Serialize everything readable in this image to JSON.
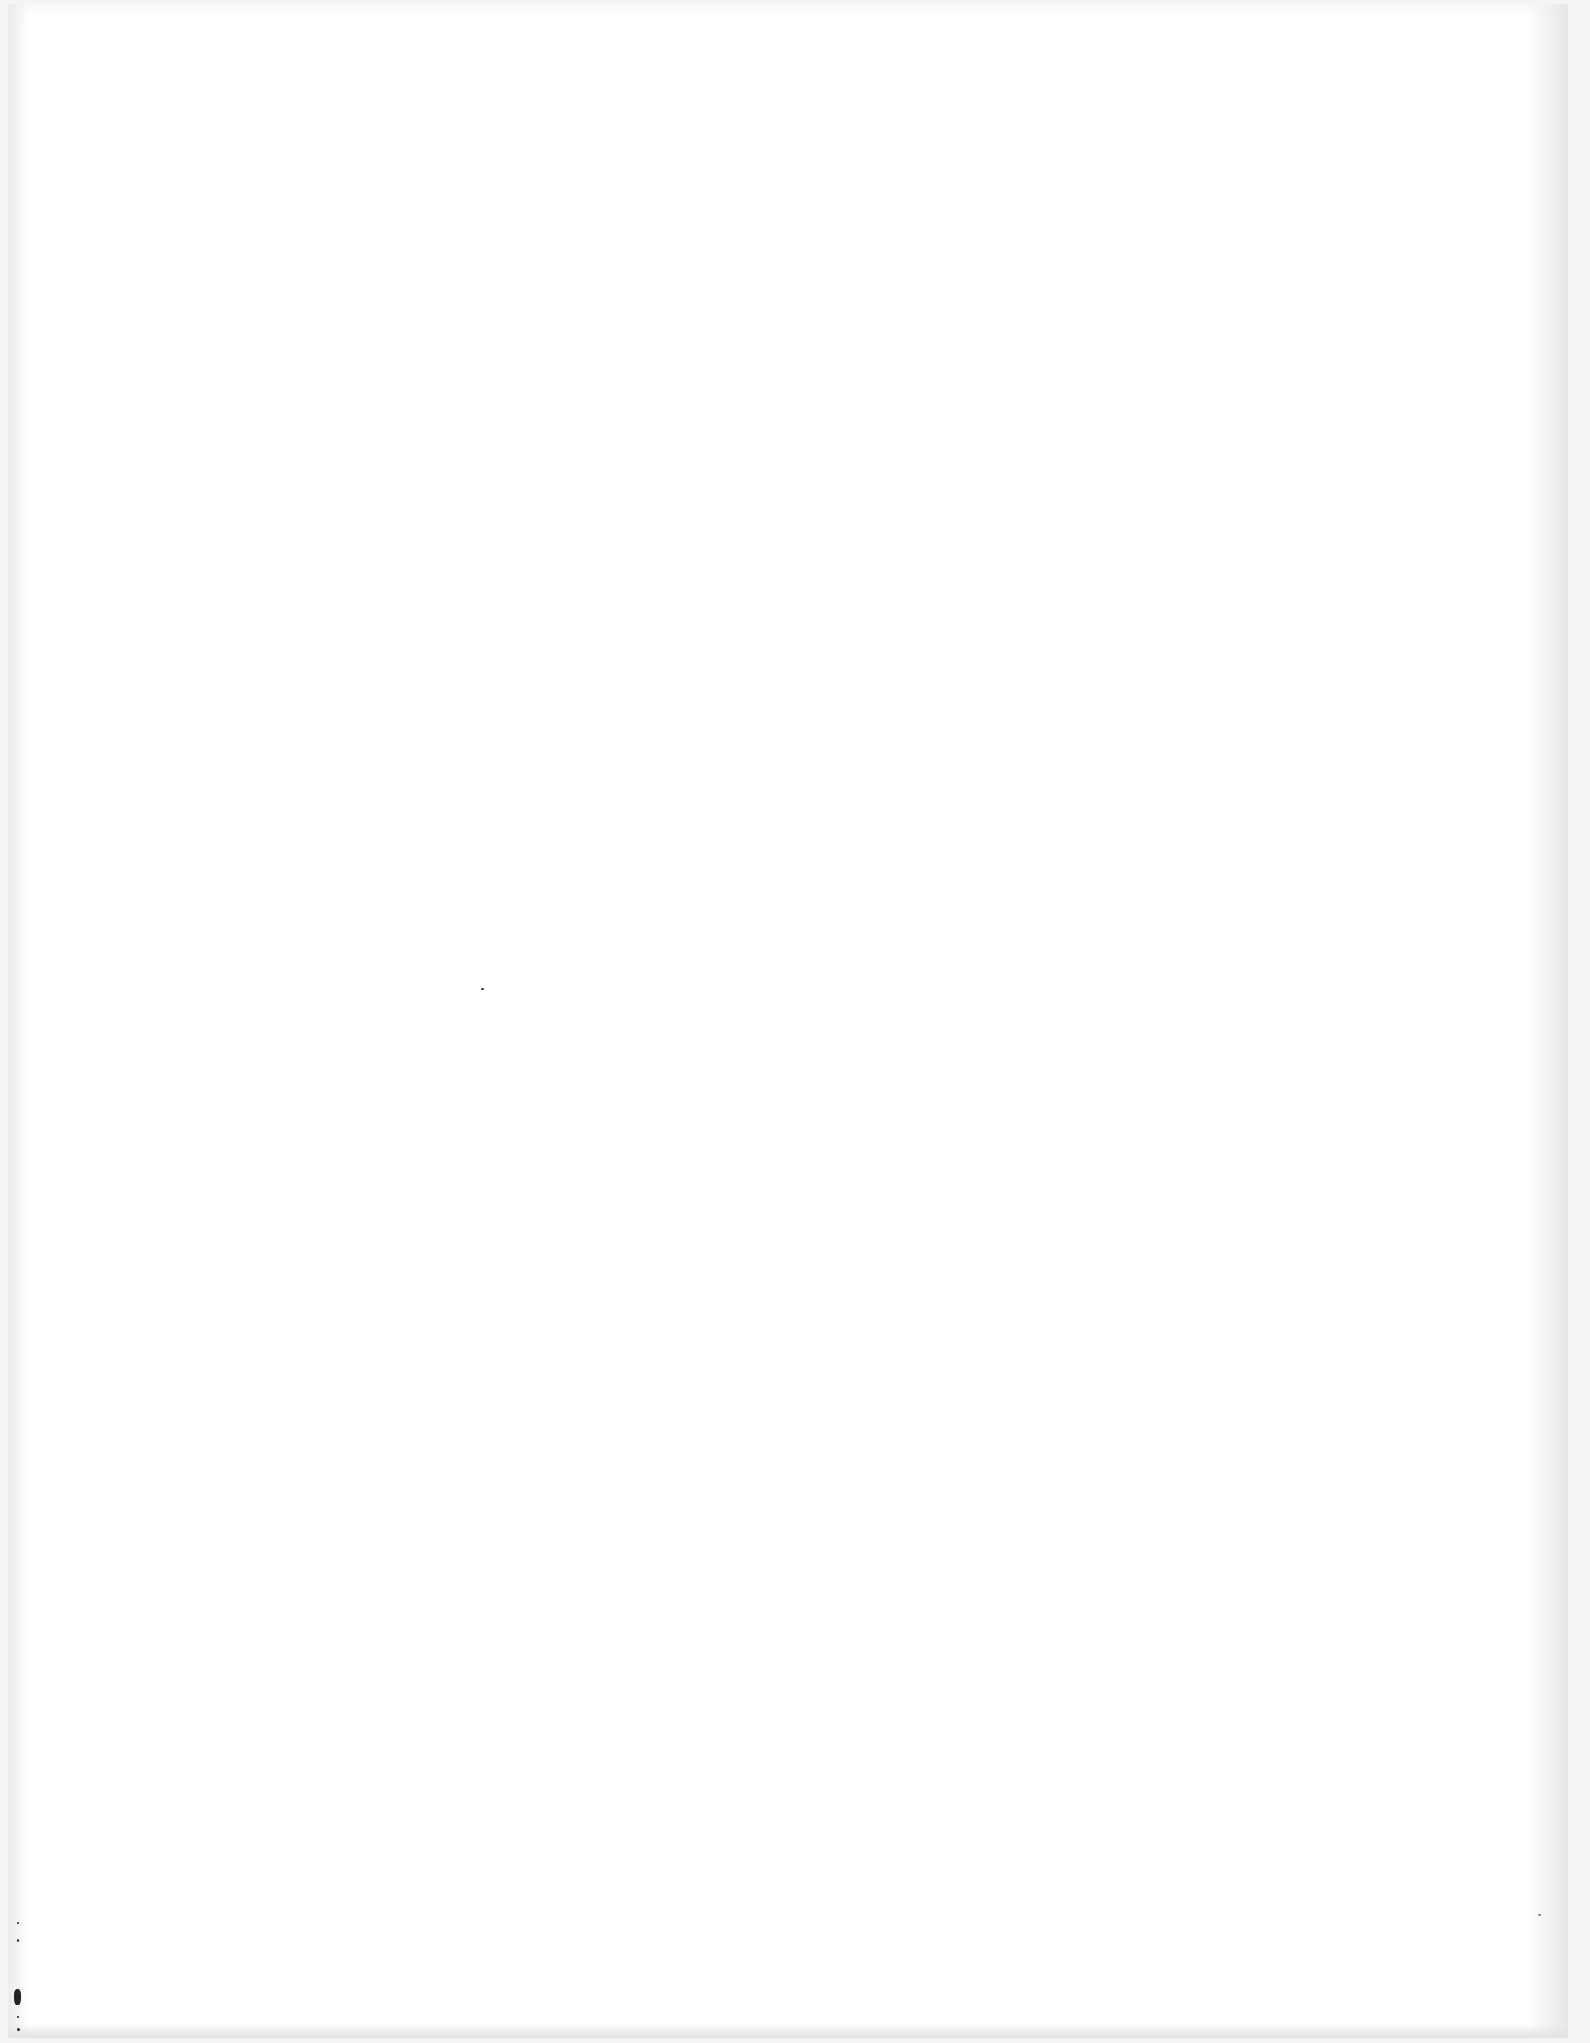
{
  "document": {
    "type": "blank scanned page",
    "body_text": "",
    "page_number": ""
  }
}
